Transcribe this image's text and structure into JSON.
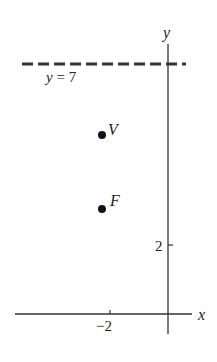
{
  "diagram": {
    "type": "parabola focus-directrix",
    "axes": {
      "x_label": "x",
      "y_label": "y",
      "x_ticks": [
        {
          "value": -2,
          "label": "−2"
        }
      ],
      "y_ticks": [
        {
          "value": 2,
          "label": "2"
        }
      ]
    },
    "directrix": {
      "label": "y = 7",
      "value": 7,
      "style": "dashed"
    },
    "points": [
      {
        "name": "V",
        "x": -2,
        "y": 5
      },
      {
        "name": "F",
        "x": -2,
        "y": 3
      }
    ],
    "colors": {
      "ink": "#222222",
      "background": "#ffffff"
    }
  }
}
